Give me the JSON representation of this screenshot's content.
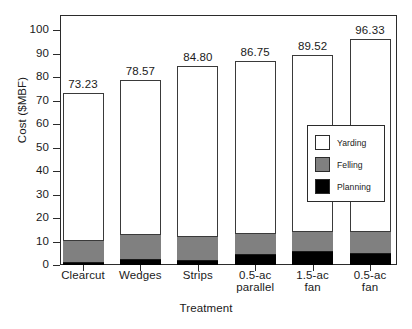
{
  "chart_data": {
    "type": "bar",
    "stacked": true,
    "title": "",
    "xlabel": "Treatment",
    "ylabel": "Cost ($MBF)",
    "ylim": [
      0,
      100
    ],
    "ytick_step": 10,
    "yticks": [
      "100",
      "90",
      "80",
      "70",
      "60",
      "50",
      "40",
      "30",
      "20",
      "10",
      "0"
    ],
    "grid": false,
    "legend_position": "inside-right",
    "categories": [
      "Clearcut",
      "Wedges",
      "Strips",
      "0.5-ac parallel",
      "1.5-ac fan",
      "0.5-ac fan"
    ],
    "category_lines": [
      [
        "Clearcut",
        ""
      ],
      [
        "Wedges",
        ""
      ],
      [
        "Strips",
        ""
      ],
      [
        "0.5-ac",
        "parallel"
      ],
      [
        "1.5-ac",
        "fan"
      ],
      [
        "0.5-ac",
        "fan"
      ]
    ],
    "series": [
      {
        "name": "Planning",
        "color": "#000000",
        "values": [
          0.7,
          2.0,
          1.9,
          4.2,
          5.5,
          4.9
        ]
      },
      {
        "name": "Felling",
        "color": "#808080",
        "values": [
          9.6,
          10.6,
          9.9,
          9.1,
          8.7,
          9.0
        ]
      },
      {
        "name": "Yarding",
        "color": "#ffffff",
        "values": [
          62.93,
          65.97,
          73.0,
          73.45,
          75.32,
          82.43
        ]
      }
    ],
    "totals": [
      73.23,
      78.57,
      84.8,
      86.75,
      89.52,
      96.33
    ],
    "value_labels": [
      "73.23",
      "78.57",
      "84.80",
      "86.75",
      "89.52",
      "96.33"
    ],
    "segment_tops": {
      "planning": [
        0.7,
        2.0,
        1.9,
        4.2,
        5.5,
        4.9
      ],
      "felling": [
        10.3,
        12.6,
        11.8,
        13.3,
        14.2,
        13.9
      ]
    }
  },
  "legend": {
    "items": [
      {
        "label": "Yarding",
        "color": "#ffffff"
      },
      {
        "label": "Felling",
        "color": "#808080"
      },
      {
        "label": "Planning",
        "color": "#000000"
      }
    ]
  }
}
